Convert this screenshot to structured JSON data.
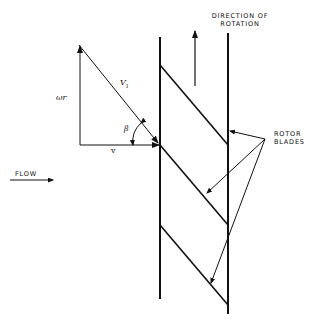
{
  "diagram": {
    "type": "axial-flow rotor blade velocity diagram",
    "labels": {
      "direction_line1": "DIRECTION OF",
      "direction_line2": "ROTATION",
      "rotor_line1": "ROTOR",
      "rotor_line2": "BLADES",
      "flow": "FLOW",
      "omega_r": "ωr",
      "v1": "V",
      "v1_sub": "1",
      "v": "v",
      "beta": "β"
    },
    "colors": {
      "ink": "#111111",
      "background": "#ffffff"
    },
    "elements": {
      "rotor_walls": 2,
      "rotor_blades": 3,
      "velocity_vectors": [
        "ωr",
        "V1",
        "v"
      ],
      "angle": "β"
    }
  }
}
